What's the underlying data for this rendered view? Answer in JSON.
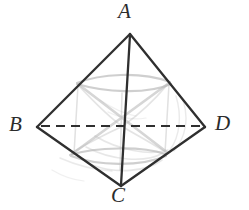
{
  "figure": {
    "background_color": "#ffffff",
    "stroke_color": "#2f2f2f",
    "ghost_color": "#b4b4b4",
    "dashed_color": "#2f2f2f",
    "labels": [
      {
        "id": "A",
        "text": "A",
        "role": "apex-vertex"
      },
      {
        "id": "B",
        "text": "B",
        "role": "left-vertex"
      },
      {
        "id": "C",
        "text": "C",
        "role": "bottom-vertex"
      },
      {
        "id": "D",
        "text": "D",
        "role": "right-vertex"
      }
    ],
    "vertices": {
      "A": {
        "x": 130,
        "y": 33
      },
      "B": {
        "x": 37,
        "y": 127
      },
      "C": {
        "x": 121,
        "y": 186
      },
      "D": {
        "x": 205,
        "y": 127
      },
      "left_mid": {
        "x": 77,
        "y": 83
      },
      "right_mid": {
        "x": 170,
        "y": 82
      },
      "lower_left_mid": {
        "x": 70,
        "y": 155
      },
      "lower_right_mid": {
        "x": 165,
        "y": 154
      },
      "center": {
        "x": 122,
        "y": 125
      }
    },
    "edges": [
      {
        "name": "A-B",
        "style": "solid"
      },
      {
        "name": "A-D",
        "style": "solid"
      },
      {
        "name": "B-C",
        "style": "solid"
      },
      {
        "name": "C-D",
        "style": "solid"
      },
      {
        "name": "A-C",
        "style": "solid"
      },
      {
        "name": "B-D",
        "style": "dashed"
      }
    ],
    "edge_notes": {
      "dashed_edge": "B-D",
      "vertical_edge": "A-C"
    }
  }
}
